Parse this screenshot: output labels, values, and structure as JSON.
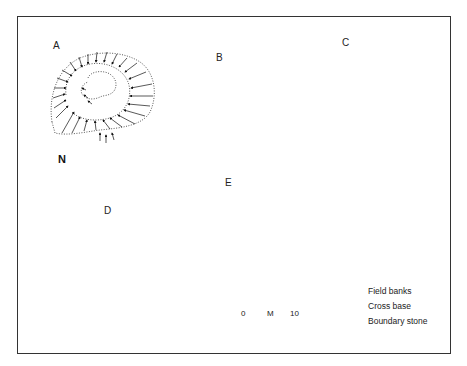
{
  "figure": {
    "sites": [
      {
        "id": "A",
        "label": "A"
      },
      {
        "id": "B",
        "label": "B"
      },
      {
        "id": "C",
        "label": "C"
      },
      {
        "id": "D",
        "label": "D"
      },
      {
        "id": "E",
        "label": "E"
      }
    ],
    "north_arrow": {
      "label": "N"
    },
    "scale_bar": {
      "start": "0",
      "unit": "M",
      "end": "10"
    },
    "legend": [
      {
        "symbol": "field-banks-icon",
        "label": "Field banks"
      },
      {
        "symbol": "cross-base-icon",
        "label": "Cross base"
      },
      {
        "symbol": "boundary-stone-icon",
        "label": "Boundary stone"
      }
    ],
    "colors": {
      "ink": "#111111",
      "background": "#ffffff",
      "frame": "#333333"
    }
  }
}
